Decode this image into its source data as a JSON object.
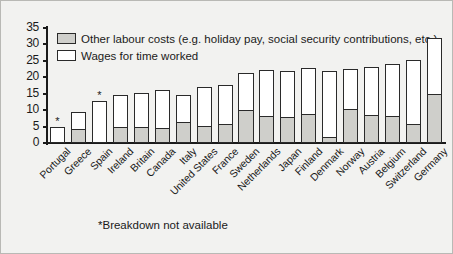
{
  "chart_data": {
    "type": "bar",
    "title": "",
    "subtitle": "",
    "xlabel": "",
    "ylabel": "",
    "ylim": [
      0,
      35
    ],
    "ytick_labels": [
      "0",
      "5",
      "10",
      "15",
      "20",
      "25",
      "30",
      "35"
    ],
    "ytick_values": [
      0,
      5,
      10,
      15,
      20,
      25,
      30,
      35
    ],
    "grid": false,
    "legend_position": "top-left",
    "stacked": true,
    "categories": [
      "Portugal",
      "Greece",
      "Spain",
      "Ireland",
      "Britain",
      "Canada",
      "Italy",
      "United States",
      "France",
      "Sweden",
      "Netherlands",
      "Japan",
      "Finland",
      "Denmark",
      "Norway",
      "Austria",
      "Belgium",
      "Switzerland",
      "Germany"
    ],
    "series": [
      {
        "name": "Wages for time worked",
        "color": "#ffffff",
        "values": [
          5.0,
          5.3,
          12.7,
          10.0,
          10.5,
          11.9,
          8.5,
          12.2,
          12.3,
          11.8,
          14.2,
          14.3,
          14.4,
          20.3,
          12.5,
          15.0,
          16.1,
          19.7,
          17.5
        ]
      },
      {
        "name": "Other labour costs (e.g. holiday pay, social security contributions, etc.)",
        "color": "#cfcfcb",
        "values": [
          0.0,
          4.0,
          0.0,
          4.6,
          4.7,
          4.3,
          6.2,
          4.8,
          5.4,
          9.6,
          7.9,
          7.7,
          8.5,
          1.6,
          10.1,
          8.2,
          7.9,
          5.5,
          14.5
        ]
      }
    ],
    "totals": [
      5.0,
      9.3,
      12.7,
      14.6,
      15.2,
      16.2,
      14.7,
      17.0,
      17.7,
      21.4,
      22.1,
      22.0,
      22.9,
      21.9,
      22.6,
      23.2,
      24.0,
      25.2,
      32.0
    ],
    "starred_categories": [
      "Portugal",
      "Spain"
    ],
    "annotations": [
      "*Breakdown not available"
    ]
  },
  "legend": {
    "entries": [
      {
        "swatch": "grey",
        "label": "Other labour costs (e.g. holiday pay, social security contributions, etc.)"
      },
      {
        "swatch": "white",
        "label": "Wages for time worked"
      }
    ]
  },
  "footnote": {
    "text": "*Breakdown not available"
  },
  "marks": {
    "star": "*"
  }
}
